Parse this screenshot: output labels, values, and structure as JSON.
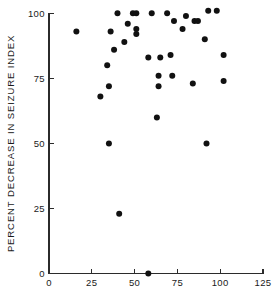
{
  "chart_data": {
    "type": "scatter",
    "title": "",
    "xlabel": "",
    "ylabel": "PERCENT DECREASE IN SEIZURE INDEX",
    "xlim": [
      0,
      125
    ],
    "ylim": [
      0,
      100
    ],
    "xticks": [
      0,
      25,
      50,
      75,
      100,
      125
    ],
    "yticks": [
      0,
      25,
      50,
      75,
      100
    ],
    "xticklabels": [
      "0",
      "25",
      "50",
      "75",
      "100",
      "125"
    ],
    "yticklabels": [
      "0",
      "25",
      "50",
      "75",
      "100"
    ],
    "grid": false,
    "legend": false,
    "marker": "filled-circle",
    "marker_color": "#111111",
    "points": [
      {
        "x": 16,
        "y": 93
      },
      {
        "x": 30,
        "y": 68
      },
      {
        "x": 34,
        "y": 80
      },
      {
        "x": 35,
        "y": 72
      },
      {
        "x": 35,
        "y": 50
      },
      {
        "x": 36,
        "y": 93
      },
      {
        "x": 38,
        "y": 86
      },
      {
        "x": 40,
        "y": 100
      },
      {
        "x": 41,
        "y": 23
      },
      {
        "x": 44,
        "y": 89
      },
      {
        "x": 46,
        "y": 96
      },
      {
        "x": 49,
        "y": 100
      },
      {
        "x": 51,
        "y": 100
      },
      {
        "x": 51,
        "y": 94
      },
      {
        "x": 51,
        "y": 92
      },
      {
        "x": 58,
        "y": 0
      },
      {
        "x": 58,
        "y": 83
      },
      {
        "x": 60,
        "y": 100
      },
      {
        "x": 63,
        "y": 60
      },
      {
        "x": 64,
        "y": 76
      },
      {
        "x": 64,
        "y": 72
      },
      {
        "x": 65,
        "y": 83
      },
      {
        "x": 69,
        "y": 100
      },
      {
        "x": 71,
        "y": 84
      },
      {
        "x": 72,
        "y": 76
      },
      {
        "x": 73,
        "y": 97
      },
      {
        "x": 78,
        "y": 94
      },
      {
        "x": 80,
        "y": 99
      },
      {
        "x": 84,
        "y": 73
      },
      {
        "x": 85,
        "y": 97
      },
      {
        "x": 87,
        "y": 97
      },
      {
        "x": 91,
        "y": 90
      },
      {
        "x": 92,
        "y": 50
      },
      {
        "x": 93,
        "y": 101
      },
      {
        "x": 98,
        "y": 101
      },
      {
        "x": 102,
        "y": 84
      },
      {
        "x": 102,
        "y": 74
      }
    ]
  }
}
